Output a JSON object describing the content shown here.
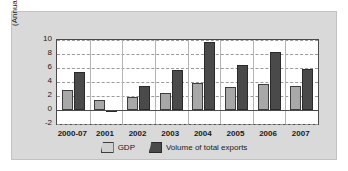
{
  "chart_data": {
    "type": "bar",
    "title": "",
    "subtitle": "",
    "xlabel": "",
    "ylabel": "(Annual percentage change)",
    "categories": [
      "2000-07",
      "2001",
      "2002",
      "2003",
      "2004",
      "2005",
      "2006",
      "2007"
    ],
    "series": [
      {
        "name": "GDP",
        "color": "#a8a8a8",
        "values": [
          2.8,
          1.4,
          1.8,
          2.5,
          3.8,
          3.3,
          3.7,
          3.4
        ]
      },
      {
        "name": "Volume of total exports",
        "color": "#4a4a4a",
        "values": [
          5.5,
          -0.3,
          3.5,
          5.7,
          9.7,
          6.4,
          8.3,
          5.9
        ]
      }
    ],
    "ylim": [
      -2,
      10
    ],
    "yticks": [
      10,
      8,
      6,
      4,
      2,
      0,
      -2
    ],
    "ytick_labels": [
      "10",
      "8",
      "6",
      "4",
      "2",
      "0",
      "-2"
    ],
    "grid": true,
    "legend_position": "bottom",
    "zero_line": true
  },
  "legend": {
    "items": [
      {
        "label": "GDP"
      },
      {
        "label": "Volume of total exports"
      }
    ]
  },
  "figure": {
    "background_color": "#d9d9d9",
    "plot_background_color": "#ffffff",
    "border_color": "#4a4a4a"
  }
}
